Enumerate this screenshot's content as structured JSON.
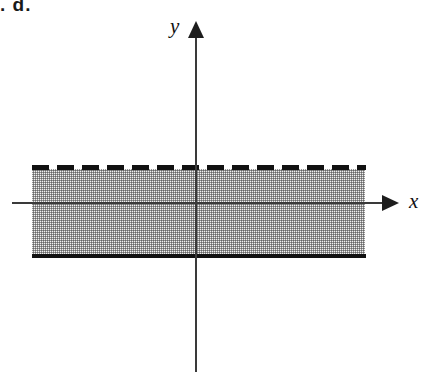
{
  "figure": {
    "caption": ". d.",
    "background_color": "#ffffff"
  },
  "axes": {
    "x": {
      "label": "x",
      "arrow_icon": "arrow-right-icon",
      "line_color": "#3a3a3a"
    },
    "y": {
      "label": "y",
      "arrow_icon": "arrow-up-icon",
      "line_color": "#3a3a3a"
    },
    "origin_visible": true,
    "tick_labels": []
  },
  "region": {
    "name": "shaded-horizontal-band",
    "fill_color": "#f2f2f2",
    "stipple_color": "#464646",
    "upper_boundary": {
      "style": "dashed",
      "color": "#111111",
      "meaning": "strict-inequality-excluded"
    },
    "lower_boundary": {
      "style": "solid",
      "color": "#111111",
      "meaning": "inclusive-inequality-included"
    }
  },
  "chart_data": {
    "type": "area",
    "title": "",
    "xlabel": "x",
    "ylabel": "y",
    "grid": false,
    "legend": null,
    "annotations": [],
    "categories": [],
    "series": [
      {
        "name": "upper boundary",
        "type": "horizontal-line",
        "line_style": "dashed",
        "y": 1.2,
        "x_range": [
          -3.7,
          3.8
        ],
        "included": false
      },
      {
        "name": "lower boundary",
        "type": "horizontal-line",
        "line_style": "solid",
        "y": -1.5,
        "x_range": [
          -3.7,
          3.8
        ],
        "included": true
      },
      {
        "name": "shaded region",
        "type": "band",
        "y_range": [
          -1.5,
          1.2
        ],
        "x_range": [
          -3.7,
          3.8
        ],
        "fill": "stipple"
      }
    ],
    "xlim": [
      -4.6,
      4.7
    ],
    "ylim": [
      -4.4,
      3.2
    ]
  }
}
